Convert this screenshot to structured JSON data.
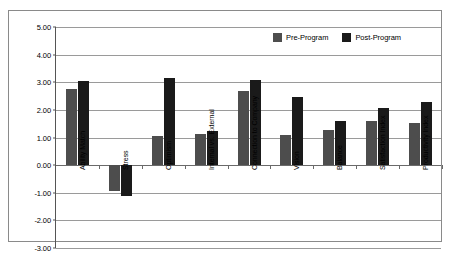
{
  "chart_data": {
    "type": "bar",
    "title": "",
    "subtitle": "",
    "xlabel": "",
    "ylabel": "",
    "grid": true,
    "legend_position": "top-right",
    "ylim": [
      -3.0,
      5.0
    ],
    "ytick_step": 1.0,
    "ytick_labels": [
      "5.00",
      "4.00",
      "3.00",
      "2.00",
      "1.00",
      "0.00",
      "-1.00",
      "-2.00",
      "-3.00"
    ],
    "ytick_values": [
      5.0,
      4.0,
      3.0,
      2.0,
      1.0,
      0.0,
      -1.0,
      -2.0,
      -3.0
    ],
    "categories": [
      "Ability Match",
      "Stress",
      "Optimism",
      "Internal vs. External",
      "Connection to Company",
      "Vision",
      "Balance",
      "Satisfaction Index",
      "Productivity Index"
    ],
    "series": [
      {
        "name": "Pre-Program",
        "color": "#4d4d4d",
        "values": [
          2.75,
          -0.92,
          1.05,
          1.13,
          2.68,
          1.1,
          1.28,
          1.58,
          1.52
        ]
      },
      {
        "name": "Post-Program",
        "color": "#1a1a1a",
        "values": [
          3.05,
          -1.12,
          3.15,
          1.22,
          3.08,
          2.48,
          1.58,
          2.05,
          2.3
        ]
      }
    ]
  },
  "legend": {
    "items": [
      {
        "label": "Pre-Program",
        "swatch": "pre"
      },
      {
        "label": "Post-Program",
        "swatch": "post"
      }
    ]
  },
  "colors": {
    "pre_program": "#4d4d4d",
    "post_program": "#1a1a1a",
    "gridline": "#9a9a9a",
    "frame": "#8a8a8a",
    "background": "#ffffff"
  }
}
